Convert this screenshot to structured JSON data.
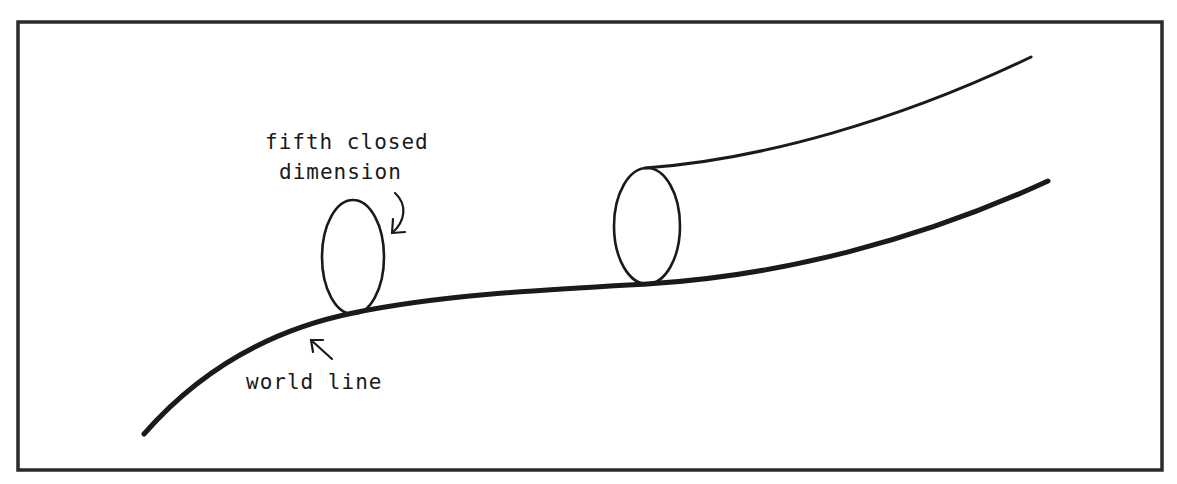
{
  "figure": {
    "labels": {
      "dimension_line1": "fifth closed",
      "dimension_line2": "dimension",
      "world_line": "world line"
    },
    "colors": {
      "ink": "#1a1a1a",
      "frame": "#2a2a2a",
      "background": "#ffffff"
    }
  }
}
